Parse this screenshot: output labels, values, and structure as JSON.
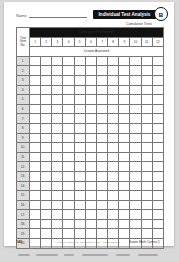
{
  "header": {
    "name_label": "Name",
    "title": "Individual Test Analysis Form",
    "title_badge": "B",
    "subtitle": "Cumulative Tests"
  },
  "table": {
    "item_header": "Test Item No.",
    "group_header": "Cumulative Test Number",
    "lesson_header": "Lesson Assessed",
    "columns": [
      "1",
      "2",
      "3",
      "4",
      "5",
      "6",
      "7",
      "8",
      "9",
      "10",
      "11",
      "12"
    ],
    "values_legible": false,
    "rows": [
      {
        "item": "1.",
        "cells": [
          "",
          "",
          "",
          "",
          "",
          "",
          "",
          "",
          "",
          "",
          "",
          ""
        ]
      },
      {
        "item": "2.",
        "cells": [
          "",
          "",
          "",
          "",
          "",
          "",
          "",
          "",
          "",
          "",
          "",
          ""
        ]
      },
      {
        "item": "3.",
        "cells": [
          "",
          "",
          "",
          "",
          "",
          "",
          "",
          "",
          "",
          "",
          "",
          ""
        ]
      },
      {
        "item": "4.",
        "cells": [
          "",
          "",
          "",
          "",
          "",
          "",
          "",
          "",
          "",
          "",
          "",
          ""
        ]
      },
      {
        "item": "5.",
        "cells": [
          "",
          "",
          "",
          "",
          "",
          "",
          "",
          "",
          "",
          "",
          "",
          ""
        ]
      },
      {
        "item": "6.",
        "cells": [
          "",
          "",
          "",
          "",
          "",
          "",
          "",
          "",
          "",
          "",
          "",
          ""
        ]
      },
      {
        "item": "7.",
        "cells": [
          "",
          "",
          "",
          "",
          "",
          "",
          "",
          "",
          "",
          "",
          "",
          ""
        ]
      },
      {
        "item": "8.",
        "cells": [
          "",
          "",
          "",
          "",
          "",
          "",
          "",
          "",
          "",
          "",
          "",
          ""
        ]
      },
      {
        "item": "9.",
        "cells": [
          "",
          "",
          "",
          "",
          "",
          "",
          "",
          "",
          "",
          "",
          "",
          ""
        ]
      },
      {
        "item": "10.",
        "cells": [
          "",
          "",
          "",
          "",
          "",
          "",
          "",
          "",
          "",
          "",
          "",
          ""
        ]
      },
      {
        "item": "11.",
        "cells": [
          "",
          "",
          "",
          "",
          "",
          "",
          "",
          "",
          "",
          "",
          "",
          ""
        ]
      },
      {
        "item": "12.",
        "cells": [
          "",
          "",
          "",
          "",
          "",
          "",
          "",
          "",
          "",
          "",
          "",
          ""
        ]
      },
      {
        "item": "13.",
        "cells": [
          "",
          "",
          "",
          "",
          "",
          "",
          "",
          "",
          "",
          "",
          "",
          ""
        ]
      },
      {
        "item": "14.",
        "cells": [
          "",
          "",
          "",
          "",
          "",
          "",
          "",
          "",
          "",
          "",
          "",
          ""
        ]
      },
      {
        "item": "15.",
        "cells": [
          "",
          "",
          "",
          "",
          "",
          "",
          "",
          "",
          "",
          "",
          "",
          ""
        ]
      },
      {
        "item": "16.",
        "cells": [
          "",
          "",
          "",
          "",
          "",
          "",
          "",
          "",
          "",
          "",
          "",
          ""
        ]
      },
      {
        "item": "17.",
        "cells": [
          "",
          "",
          "",
          "",
          "",
          "",
          "",
          "",
          "",
          "",
          "",
          ""
        ]
      },
      {
        "item": "18.",
        "cells": [
          "",
          "",
          "",
          "",
          "",
          "",
          "",
          "",
          "",
          "",
          "",
          ""
        ]
      },
      {
        "item": "19.",
        "cells": [
          "",
          "",
          "",
          "",
          "",
          "",
          "",
          "",
          "",
          "",
          "",
          ""
        ]
      },
      {
        "item": "20.",
        "cells": [
          "",
          "",
          "",
          "",
          "",
          "",
          "",
          "",
          "",
          "",
          "",
          ""
        ]
      }
    ]
  },
  "footer": {
    "page_number": "140",
    "copyright": "© Harcourt Achieve Inc. and Stephen Hake. All rights reserved.",
    "book": "Saxon Math Course 1"
  }
}
